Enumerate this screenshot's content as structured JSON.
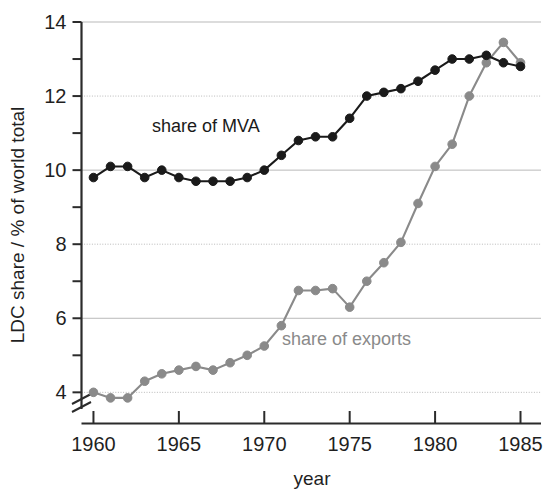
{
  "chart_data": {
    "type": "line",
    "title": "",
    "xlabel": "year",
    "ylabel": "LDC share / % of world total",
    "xlim": [
      1959.3,
      1986.2
    ],
    "ylim": [
      3.55,
      14
    ],
    "xticks": [
      1960,
      1965,
      1970,
      1975,
      1980,
      1985
    ],
    "xtick_labels": [
      "1960",
      "1965",
      "1970",
      "1975",
      "1980",
      "1985"
    ],
    "yticks": [
      4,
      6,
      8,
      10,
      12,
      14
    ],
    "ytick_labels": [
      "4",
      "6",
      "8",
      "10",
      "12",
      "14"
    ],
    "yminor_ticks": [
      5,
      7,
      9,
      11,
      13
    ],
    "grid": "horizontal-major",
    "axis_break": "y-axis break below 4",
    "legend_position": "inline-annotations",
    "x": [
      1960,
      1961,
      1962,
      1963,
      1964,
      1965,
      1966,
      1967,
      1968,
      1969,
      1970,
      1971,
      1972,
      1973,
      1974,
      1975,
      1976,
      1977,
      1978,
      1979,
      1980,
      1981,
      1982,
      1983,
      1984,
      1985
    ],
    "series": [
      {
        "name": "share of MVA",
        "color": "#1a1a1a",
        "label_text": "share of MVA",
        "values": [
          9.8,
          10.1,
          10.1,
          9.8,
          10.0,
          9.8,
          9.7,
          9.7,
          9.7,
          9.8,
          10.0,
          10.4,
          10.8,
          10.9,
          10.9,
          11.4,
          12.0,
          12.1,
          12.2,
          12.4,
          12.7,
          13.0,
          13.0,
          13.1,
          12.9,
          12.8
        ]
      },
      {
        "name": "share of exports",
        "color": "#8a8a8a",
        "label_text": "share of exports",
        "values": [
          4.0,
          3.85,
          3.85,
          4.3,
          4.5,
          4.6,
          4.7,
          4.6,
          4.8,
          5.0,
          5.25,
          5.8,
          6.75,
          6.75,
          6.8,
          6.3,
          7.0,
          7.5,
          8.05,
          9.1,
          10.1,
          10.7,
          12.0,
          12.9,
          13.45,
          12.9
        ]
      }
    ]
  }
}
